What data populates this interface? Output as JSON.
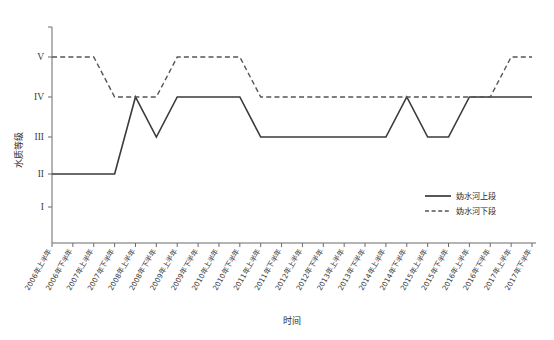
{
  "chart_data": {
    "type": "line",
    "title": "",
    "xlabel": "时间",
    "ylabel": "水质等级",
    "grid": false,
    "legend_position": "inside-right",
    "ylim": [
      "I",
      "V"
    ],
    "ytick_labels": [
      "I",
      "II",
      "III",
      "IV",
      "V"
    ],
    "ylevels": [
      1,
      2,
      3,
      4,
      5
    ],
    "categories": [
      "2006年上半年",
      "2006年下半年",
      "2007年上半年",
      "2007年下半年",
      "2008年上半年",
      "2008年下半年",
      "2009年上半年",
      "2009年下半年",
      "2010年上半年",
      "2010年下半年",
      "2011年上半年",
      "2011年下半年",
      "2012年上半年",
      "2012年下半年",
      "2013年上半年",
      "2013年下半年",
      "2014年上半年",
      "2014年下半年",
      "2015年上半年",
      "2015年下半年",
      "2016年上半年",
      "2016年下半年",
      "2017年上半年",
      "2017年下半年"
    ],
    "series": [
      {
        "name": "妫水河上段",
        "style": "solid",
        "color": "#3a3a3a",
        "values": [
          2,
          2,
          2,
          2,
          4,
          3,
          4,
          4,
          4,
          4,
          3,
          3,
          3,
          3,
          3,
          3,
          3,
          4,
          3,
          3,
          4,
          4,
          4,
          4
        ],
        "grade_labels": [
          "II",
          "II",
          "II",
          "II",
          "IV",
          "III",
          "IV",
          "IV",
          "IV",
          "IV",
          "III",
          "III",
          "III",
          "III",
          "III",
          "III",
          "III",
          "IV",
          "III",
          "III",
          "IV",
          "IV",
          "IV",
          "IV"
        ]
      },
      {
        "name": "妫水河下段",
        "style": "dashed",
        "color": "#555555",
        "values": [
          5,
          5,
          5,
          4,
          4,
          4,
          5,
          5,
          5,
          5,
          4,
          4,
          4,
          4,
          4,
          4,
          4,
          4,
          4,
          4,
          4,
          4,
          5,
          5
        ],
        "grade_labels": [
          "V",
          "V",
          "V",
          "IV",
          "IV",
          "IV",
          "V",
          "V",
          "V",
          "V",
          "IV",
          "IV",
          "IV",
          "IV",
          "IV",
          "IV",
          "IV",
          "IV",
          "IV",
          "IV",
          "IV",
          "IV",
          "V",
          "V"
        ]
      }
    ]
  },
  "legend": {
    "items": [
      {
        "label": "妫水河上段",
        "style": "solid"
      },
      {
        "label": "妫水河下段",
        "style": "dashed"
      }
    ]
  },
  "axes": {
    "y_title": "水质等级",
    "x_title": "时间"
  }
}
